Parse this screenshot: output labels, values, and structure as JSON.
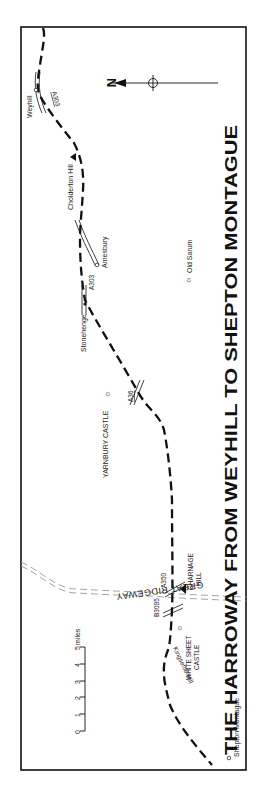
{
  "title": "THE HARROWAY FROM WEYHILL TO SHEPTON MONTAGUE",
  "places": {
    "weyhill": "Weyhill",
    "cholderton_hill": "Cholderton Hill",
    "amesbury": "Amesbury",
    "stonehenge": "Stonehenge",
    "old_sarum": "Old Sarum",
    "yarnbury_castle": "YARNBURY CASTLE",
    "charnage_hill_1": "CHARNAGE",
    "charnage_hill_2": "HILL",
    "white_sheet_castle_1": "WHITE SHEET",
    "white_sheet_castle_2": "CASTLE",
    "kingsettle_hill": "Kingsettle Hill",
    "shepton_montague": "Shepton Montague",
    "great_ridgeway": "GREAT RIDGEWAY"
  },
  "roads": {
    "a303_top": "A303",
    "a303_mid": "A303",
    "a36": "A36",
    "a350": "A350",
    "b3095": "B3095"
  },
  "compass": {
    "label": "N"
  },
  "scale": {
    "ticks": [
      "0",
      "1",
      "2",
      "3",
      "4",
      "5"
    ],
    "unit": "miles"
  },
  "colors": {
    "ink": "#111111",
    "ridgeway": "#9a9a9a",
    "background": "#ffffff"
  }
}
